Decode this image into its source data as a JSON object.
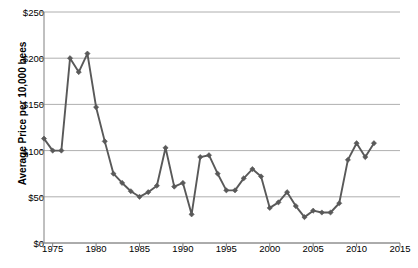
{
  "chart_data": {
    "type": "line",
    "title": "",
    "xlabel": "",
    "ylabel": "Average Price per 10,000 bees",
    "xlim": [
      1974,
      2015
    ],
    "ylim": [
      0,
      250
    ],
    "ytick_labels": [
      "$0",
      "$50",
      "$100",
      "$150",
      "$200",
      "$250"
    ],
    "ytick_values": [
      0,
      50,
      100,
      150,
      200,
      250
    ],
    "xtick_labels": [
      "1975",
      "1980",
      "1985",
      "1990",
      "1995",
      "2000",
      "2005",
      "2010",
      "2015"
    ],
    "xtick_values": [
      1975,
      1980,
      1985,
      1990,
      1995,
      2000,
      2005,
      2010,
      2015
    ],
    "grid": "horizontal",
    "legend": "none",
    "marker": "diamond",
    "series_color": "#595959",
    "grid_color": "#9a9a9a",
    "axis_color": "#808080",
    "x": [
      1974,
      1975,
      1976,
      1977,
      1978,
      1979,
      1980,
      1981,
      1982,
      1983,
      1984,
      1985,
      1986,
      1987,
      1988,
      1989,
      1990,
      1991,
      1992,
      1993,
      1994,
      1995,
      1996,
      1997,
      1998,
      1999,
      2000,
      2001,
      2002,
      2003,
      2004,
      2005,
      2006,
      2007,
      2008,
      2009,
      2010,
      2011,
      2012
    ],
    "values": [
      113,
      100,
      100,
      200,
      185,
      205,
      147,
      110,
      75,
      65,
      56,
      50,
      55,
      62,
      103,
      61,
      65,
      31,
      93,
      95,
      75,
      57,
      57,
      70,
      80,
      72,
      38,
      44,
      55,
      40,
      28,
      35,
      33,
      33,
      43,
      90,
      108,
      93,
      108
    ]
  }
}
